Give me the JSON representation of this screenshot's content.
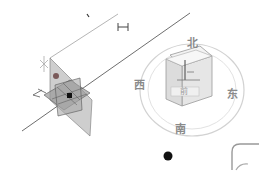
{
  "viewport": {
    "background": "#ffffff",
    "grid_line_color": "#9a9a9a"
  },
  "gizmo": {
    "plane_color": "#8c8c8c",
    "center_dot_color": "#111111",
    "handle_dot_color": "#7a5a5a",
    "scale_marker": "⊢⊣"
  },
  "viewcube": {
    "front_label": "前",
    "top_label": "上",
    "ring_color": "#cfcfcf",
    "compass": {
      "north": "北",
      "west": "西",
      "east": "东",
      "south": "南"
    }
  },
  "origin_point": {
    "color": "#111111"
  },
  "corner_widget": {
    "icon": "home-view-icon"
  }
}
